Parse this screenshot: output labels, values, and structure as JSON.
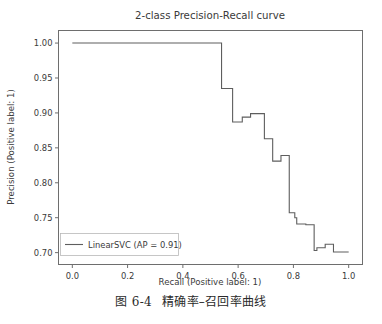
{
  "figure": {
    "caption_number": "图 6-4",
    "caption_text": "精确率–召回率曲线"
  },
  "chart_data": {
    "type": "line",
    "subtype": "step-post",
    "title": "2-class Precision-Recall curve",
    "xlabel": "Recall (Positive label: 1)",
    "ylabel": "Precision (Positive label: 1)",
    "xlim": [
      -0.05,
      1.05
    ],
    "ylim": [
      0.683,
      1.018
    ],
    "xticks": [
      0.0,
      0.2,
      0.4,
      0.6,
      0.8,
      1.0
    ],
    "xticklabels": [
      "0.0",
      "0.2",
      "0.4",
      "0.6",
      "0.8",
      "1.0"
    ],
    "yticks": [
      0.7,
      0.75,
      0.8,
      0.85,
      0.9,
      0.95,
      1.0
    ],
    "yticklabels": [
      "0.70",
      "0.75",
      "0.80",
      "0.85",
      "0.90",
      "0.95",
      "1.00"
    ],
    "grid": false,
    "legend_position": "lower left",
    "line_color": "#5e5e5e",
    "series": [
      {
        "name": "LinearSVC (AP = 0.91)",
        "average_precision": 0.91,
        "estimator": "LinearSVC",
        "x": [
          0.0,
          0.54,
          0.54,
          0.58,
          0.58,
          0.615,
          0.615,
          0.645,
          0.645,
          0.695,
          0.695,
          0.725,
          0.725,
          0.755,
          0.755,
          0.785,
          0.785,
          0.805,
          0.805,
          0.812,
          0.812,
          0.845,
          0.845,
          0.875,
          0.875,
          0.885,
          0.885,
          0.915,
          0.915,
          0.945,
          0.945,
          0.96,
          0.96,
          1.0
        ],
        "y": [
          1.0,
          1.0,
          0.935,
          0.935,
          0.887,
          0.887,
          0.894,
          0.894,
          0.899,
          0.899,
          0.863,
          0.863,
          0.831,
          0.831,
          0.839,
          0.839,
          0.757,
          0.757,
          0.75,
          0.75,
          0.741,
          0.741,
          0.74,
          0.74,
          0.703,
          0.703,
          0.707,
          0.707,
          0.712,
          0.712,
          0.701,
          0.701,
          0.701,
          0.701
        ]
      }
    ]
  }
}
